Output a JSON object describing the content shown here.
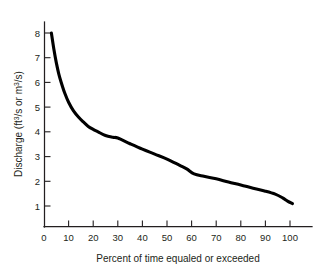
{
  "chart_data": {
    "type": "line",
    "title": "",
    "xlabel": "Percent of time equaled or exceeded",
    "ylabel": "Discharge (ft3/s or m3/s)",
    "ylabel_parts": {
      "pre": "Discharge (ft",
      "sup1": "3",
      "mid": "/s or m",
      "sup2": "3",
      "post": "/s)"
    },
    "xlim": [
      0,
      112
    ],
    "ylim": [
      0,
      8.7
    ],
    "xticks": [
      0,
      10,
      20,
      30,
      40,
      50,
      60,
      70,
      80,
      90,
      100
    ],
    "xtick_labels": [
      "0",
      "10",
      "20",
      "30",
      "40",
      "50",
      "60",
      "70",
      "80",
      "90",
      "100"
    ],
    "xticks_with_marks": [
      10,
      20,
      30,
      40,
      50,
      60,
      70,
      80,
      90,
      100
    ],
    "yticks": [
      1,
      2,
      3,
      4,
      5,
      6,
      7,
      8
    ],
    "ytick_labels": [
      "1",
      "2",
      "3",
      "4",
      "5",
      "6",
      "7",
      "8"
    ],
    "grid": false,
    "legend": false,
    "series": [
      {
        "name": "Flow duration curve",
        "color": "#000000",
        "x": [
          3.0,
          4.0,
          5.0,
          6.0,
          7.0,
          8.5,
          10.0,
          12.0,
          14.0,
          16.0,
          18.0,
          20.0,
          22.0,
          25.0,
          28.0,
          30.0,
          35.0,
          40.0,
          45.0,
          50.0,
          55.0,
          58.0,
          61.0,
          65.0,
          70.0,
          75.0,
          80.0,
          85.0,
          90.0,
          94.0,
          97.0,
          99.0,
          101.0
        ],
        "y": [
          8.0,
          7.35,
          6.8,
          6.35,
          6.0,
          5.55,
          5.2,
          4.85,
          4.6,
          4.4,
          4.22,
          4.1,
          4.0,
          3.85,
          3.78,
          3.75,
          3.52,
          3.3,
          3.1,
          2.9,
          2.65,
          2.5,
          2.3,
          2.2,
          2.1,
          1.97,
          1.85,
          1.72,
          1.6,
          1.48,
          1.33,
          1.2,
          1.1
        ]
      }
    ]
  },
  "axes": {
    "x_axis_name": "percent-of-time-axis",
    "y_axis_name": "discharge-axis"
  }
}
